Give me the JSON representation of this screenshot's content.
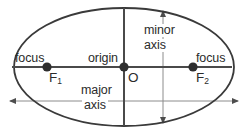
{
  "figure": {
    "type": "geometry-diagram",
    "width": 244,
    "height": 136,
    "background_color": "#ffffff",
    "stroke_color": "#3a3a3a",
    "thin_stroke_color": "#8c8c8c",
    "text_color": "#2b2b2b"
  },
  "shape": {
    "name": "ellipse",
    "center_x": 124,
    "center_y": 67,
    "semi_major_axis": 110,
    "semi_minor_axis": 59
  },
  "labels": {
    "focus_left": "focus",
    "focus_left_point": "F",
    "focus_left_point_subscript": "1",
    "focus_right": "focus",
    "focus_right_point": "F",
    "focus_right_point_subscript": "2",
    "origin": "origin",
    "origin_point": "O",
    "minor_axis_line1": "minor",
    "minor_axis_line2": "axis",
    "major_axis_line1": "major",
    "major_axis_line2": "axis"
  },
  "points": [
    {
      "name": "focus-left",
      "label": "F1",
      "x": 47,
      "y": 67
    },
    {
      "name": "origin",
      "label": "O",
      "x": 124,
      "y": 67
    },
    {
      "name": "focus-right",
      "label": "F2",
      "x": 193,
      "y": 67
    }
  ],
  "axes": {
    "major": {
      "name": "major-axis",
      "orientation": "horizontal",
      "y": 101,
      "x_start": 10,
      "x_end": 238,
      "arrows": "both"
    },
    "minor": {
      "name": "minor-axis",
      "orientation": "vertical",
      "x": 163,
      "y_start": 11,
      "y_end": 123,
      "arrows": "both"
    },
    "horizontal_center": {
      "name": "horizontal-center-line",
      "y": 67,
      "x_start": 12,
      "x_end": 232
    },
    "vertical_center": {
      "name": "vertical-center-line",
      "x": 124,
      "y_start": 8,
      "y_end": 126
    }
  }
}
